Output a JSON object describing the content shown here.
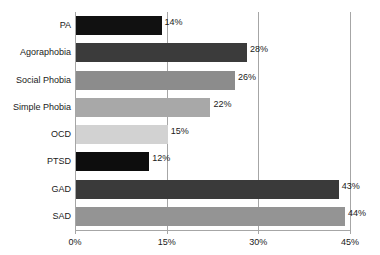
{
  "chart_data": {
    "type": "bar",
    "orientation": "horizontal",
    "title": "",
    "xlabel": "",
    "ylabel": "",
    "xlim": [
      0,
      45
    ],
    "grid": true,
    "legend": "none",
    "xticks": [
      "0%",
      "15%",
      "30%",
      "45%"
    ],
    "xtick_values": [
      0,
      15,
      30,
      45
    ],
    "categories": [
      "PA",
      "Agoraphobia",
      "Social Phobia",
      "Simple Phobia",
      "OCD",
      "PTSD",
      "GAD",
      "SAD"
    ],
    "values": [
      14,
      28,
      26,
      22,
      15,
      12,
      43,
      44
    ],
    "value_labels": [
      "14%",
      "28%",
      "26%",
      "22%",
      "15%",
      "12%",
      "43%",
      "44%"
    ],
    "bar_colors": [
      "#111111",
      "#3b3b3b",
      "#8c8c8c",
      "#a8a8a8",
      "#d2d2d2",
      "#0d0d0d",
      "#3a3a3a",
      "#949494"
    ],
    "axis_color": "#a6a6a6",
    "text_color": "#1a1a1a",
    "background": "#ffffff"
  }
}
